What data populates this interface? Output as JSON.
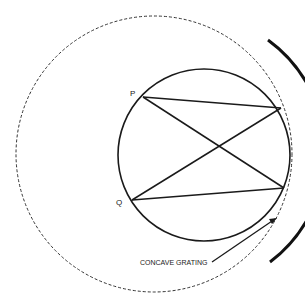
{
  "diagram": {
    "type": "rowland-circle-concave-grating",
    "labels": {
      "point_p": "P",
      "point_q": "Q",
      "grating": "CONCAVE GRATING"
    },
    "colors": {
      "stroke": "#1a1a1a",
      "background": "#ffffff"
    }
  }
}
